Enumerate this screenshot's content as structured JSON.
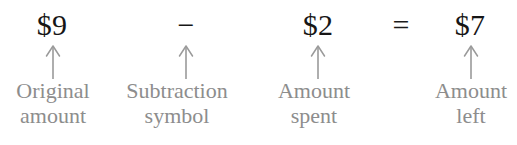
{
  "figure": {
    "type": "math-equation-annotated-diagram",
    "equation": "$9 − $2 = $7",
    "background_color": "#ffffff",
    "term_color": "#161616",
    "label_color": "#8d8d8d",
    "arrow_color": "#9a9a9a"
  },
  "equation": {
    "terms": [
      {
        "value": "$9",
        "label_line1": "Original",
        "label_line2": "amount"
      },
      {
        "value": "−",
        "label_line1": "Subtraction",
        "label_line2": "symbol"
      },
      {
        "value": "$2",
        "label_line1": "Amount",
        "label_line2": "spent"
      },
      {
        "value": "$7",
        "label_line1": "Amount",
        "label_line2": "left"
      }
    ],
    "operators": [
      {
        "symbol": "=",
        "name": "equals-sign"
      }
    ]
  },
  "arrows": {
    "count": 4,
    "direction": "up",
    "name": "pointer-arrow"
  }
}
